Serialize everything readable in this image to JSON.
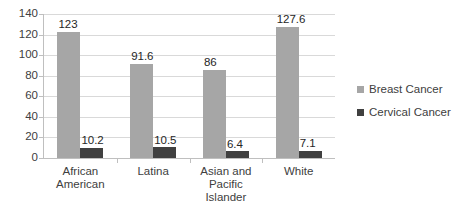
{
  "chart_data": {
    "type": "bar",
    "title": "",
    "subtitle": "",
    "xlabel": "",
    "ylabel": "",
    "ylim": [
      0,
      140
    ],
    "ytick_step": 20,
    "ytick_labels": [
      "140",
      "120",
      "100",
      "80",
      "60",
      "40",
      "20",
      "0"
    ],
    "ytick_values": [
      140,
      120,
      100,
      80,
      60,
      40,
      20,
      0
    ],
    "grid": "horizontal",
    "legend_position": "right",
    "categories": [
      "African American",
      "Latina",
      "Asian and Pacific Islander",
      "White"
    ],
    "category_lines": [
      [
        "African",
        "American"
      ],
      [
        "Latina"
      ],
      [
        "Asian and",
        "Pacific",
        "Islander"
      ],
      [
        "White"
      ]
    ],
    "series": [
      {
        "name": "Breast Cancer",
        "color": "#a6a6a6",
        "values": [
          123,
          91.6,
          86,
          127.6
        ],
        "labels": [
          "123",
          "91.6",
          "86",
          "127.6"
        ]
      },
      {
        "name": "Cervical Cancer",
        "color": "#404040",
        "values": [
          10.2,
          10.5,
          6.4,
          7.1
        ],
        "labels": [
          "10.2",
          "10.5",
          "6.4",
          "7.1"
        ]
      }
    ]
  },
  "legend": {
    "items": [
      {
        "label": "Breast Cancer",
        "color": "#a6a6a6"
      },
      {
        "label": "Cervical Cancer",
        "color": "#404040"
      }
    ]
  },
  "axis": {
    "y_labels": [
      "140",
      "120",
      "100",
      "80",
      "60",
      "40",
      "20",
      "0"
    ]
  },
  "colors": {
    "breast": "#a6a6a6",
    "cervical": "#404040",
    "gridline": "#d9d9d9",
    "axis": "#bfbfbf",
    "text": "#404040",
    "background": "#ffffff"
  }
}
